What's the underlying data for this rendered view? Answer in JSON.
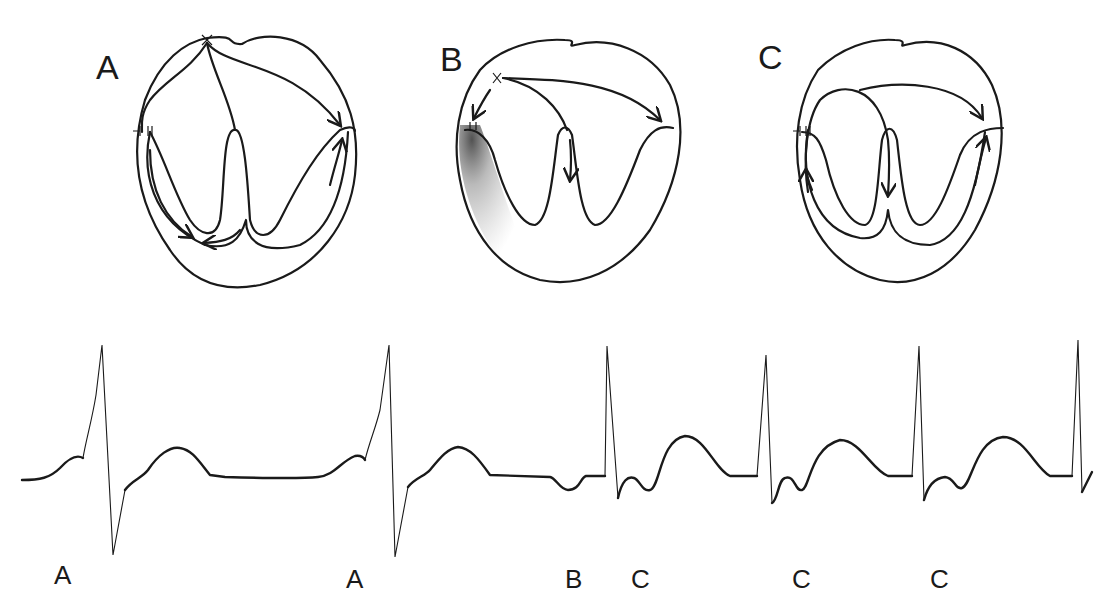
{
  "figure": {
    "hearts": [
      {
        "label": "A",
        "description": "Sinus origin impulse spreading through atria and ventricles via conduction system"
      },
      {
        "label": "B",
        "description": "Ectopic origin with blocked conduction (shaded region)"
      },
      {
        "label": "C",
        "description": "Re-entrant circuit returning through conduction pathway"
      }
    ],
    "ecg_labels": [
      {
        "id": "ecg-label-1",
        "text": "A"
      },
      {
        "id": "ecg-label-2",
        "text": "A"
      },
      {
        "id": "ecg-label-3",
        "text": "B"
      },
      {
        "id": "ecg-label-4",
        "text": "C"
      },
      {
        "id": "ecg-label-5",
        "text": "C"
      },
      {
        "id": "ecg-label-6",
        "text": "C"
      }
    ],
    "colors": {
      "ink": "#1a1a1a",
      "background": "#ffffff",
      "shading": "#555555"
    }
  }
}
